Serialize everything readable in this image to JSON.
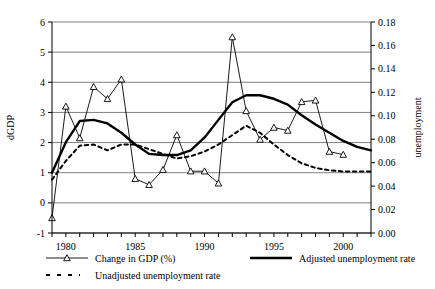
{
  "chart_data": {
    "type": "line",
    "title": "",
    "xlabel": "",
    "ylabel": "dGDP",
    "y2label": "unemployment",
    "xlim": [
      1979,
      2002
    ],
    "ylim": [
      -1,
      6
    ],
    "y2lim": [
      0.0,
      0.18
    ],
    "grid": true,
    "legend_position": "bottom",
    "x_tick_labels": [
      "1980",
      "1985",
      "1990",
      "1995",
      "2000"
    ],
    "x_tick_values": [
      1980,
      1985,
      1990,
      1995,
      2000
    ],
    "x_minor_ticks": [
      1979,
      1980,
      1981,
      1982,
      1983,
      1984,
      1985,
      1986,
      1987,
      1988,
      1989,
      1990,
      1991,
      1992,
      1993,
      1994,
      1995,
      1996,
      1997,
      1998,
      1999,
      2000,
      2001,
      2002
    ],
    "y_tick_labels": [
      "-1",
      "0",
      "1",
      "2",
      "3",
      "4",
      "5",
      "6"
    ],
    "y_tick_values": [
      -1,
      0,
      1,
      2,
      3,
      4,
      5,
      6
    ],
    "y2_tick_labels": [
      "0.00",
      "0.02",
      "0.04",
      "0.06",
      "0.08",
      "0.10",
      "0.12",
      "0.14",
      "0.16",
      "0.18"
    ],
    "y2_tick_values": [
      0.0,
      0.02,
      0.04,
      0.06,
      0.08,
      0.1,
      0.12,
      0.14,
      0.16,
      0.18
    ],
    "x": [
      1979,
      1980,
      1981,
      1982,
      1983,
      1984,
      1985,
      1986,
      1987,
      1988,
      1989,
      1990,
      1991,
      1992,
      1993,
      1994,
      1995,
      1996,
      1997,
      1998,
      1999,
      2000,
      2001,
      2002
    ],
    "series": [
      {
        "name": "Change in GDP (%)",
        "axis": "left",
        "style": "thin-marker",
        "marker": "triangle",
        "values": [
          -0.5,
          3.2,
          2.15,
          3.85,
          3.45,
          4.1,
          0.8,
          0.6,
          1.1,
          2.25,
          1.05,
          1.05,
          0.65,
          5.5,
          3.05,
          2.1,
          2.5,
          2.4,
          3.35,
          3.4,
          1.7,
          1.6,
          null,
          null
        ]
      },
      {
        "name": "Adjusted unemployment rate",
        "axis": "right",
        "style": "thick-solid",
        "marker": "none",
        "values": [
          0.0515,
          0.0775,
          0.0955,
          0.0965,
          0.0935,
          0.0855,
          0.0755,
          0.0675,
          0.0665,
          0.0665,
          0.0705,
          0.0815,
          0.0965,
          0.1115,
          0.1175,
          0.1175,
          0.1145,
          0.1095,
          0.1005,
          0.0925,
          0.0855,
          0.0785,
          0.0735,
          0.0705
        ]
      },
      {
        "name": "Unadjusted unemployment rate",
        "axis": "right",
        "style": "dotted",
        "marker": "none",
        "values": [
          0.0455,
          0.0615,
          0.0745,
          0.0755,
          0.0705,
          0.0755,
          0.0755,
          0.0715,
          0.0675,
          0.0635,
          0.0655,
          0.0695,
          0.0755,
          0.0835,
          0.0915,
          0.0855,
          0.0755,
          0.0665,
          0.0595,
          0.0555,
          0.0535,
          0.0525,
          0.0525,
          0.0525
        ]
      }
    ]
  },
  "axes": {
    "left_title": "dGDP",
    "right_title": "unemployment"
  },
  "legend": {
    "items": [
      {
        "label": "Change in GDP (%)",
        "style": "thin-marker"
      },
      {
        "label": "Adjusted unemployment rate",
        "style": "thick-solid"
      },
      {
        "label": "Unadjusted unemployment rate",
        "style": "dotted"
      }
    ]
  }
}
